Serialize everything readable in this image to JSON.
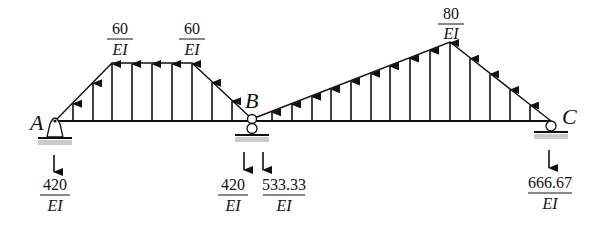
{
  "diagram": {
    "points": {
      "A": "A",
      "B": "B",
      "C": "C"
    },
    "loads": {
      "left_plateau_start": {
        "num": "60",
        "den": "EI"
      },
      "left_plateau_end": {
        "num": "60",
        "den": "EI"
      },
      "right_peak": {
        "num": "80",
        "den": "EI"
      }
    },
    "reactions": {
      "A": {
        "num": "420",
        "den": "EI",
        "direction": "down"
      },
      "B_left": {
        "num": "420",
        "den": "EI",
        "direction": "down"
      },
      "B_right": {
        "num": "533.33",
        "den": "EI",
        "direction": "down"
      },
      "C": {
        "num": "666.67",
        "den": "EI",
        "direction": "down"
      }
    },
    "supports": {
      "A": "pin",
      "B": "hinge-on-roller",
      "C": "roller"
    },
    "load_profile": {
      "left_span": {
        "shape": "trapezoid",
        "max": 60
      },
      "right_span": {
        "shape": "triangle",
        "max": 80
      }
    },
    "colors": {
      "ink": "#111111",
      "hatch": "#bbbbbb"
    }
  }
}
